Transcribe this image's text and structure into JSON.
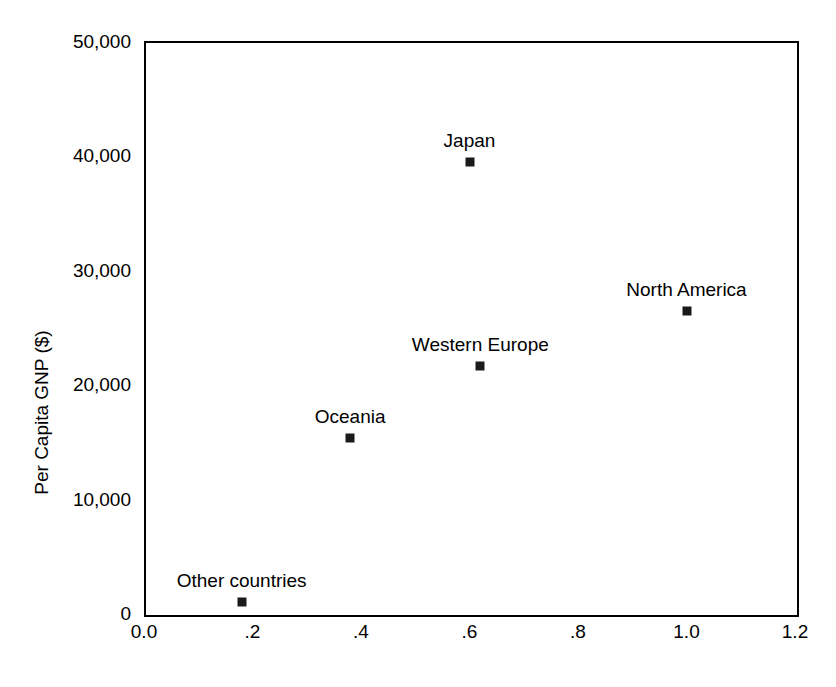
{
  "chart_data": {
    "type": "scatter",
    "title": "",
    "xlabel": "",
    "ylabel": "Per Capita GNP ($)",
    "xlim": [
      0.0,
      1.2
    ],
    "ylim": [
      0,
      50000
    ],
    "grid": false,
    "legend": "none",
    "marker": {
      "shape": "square",
      "color": "#1a1a1a",
      "size_px": 9
    },
    "xticks": [
      0.0,
      0.2,
      0.4,
      0.6,
      0.8,
      1.0,
      1.2
    ],
    "xticklabels": [
      "0.0",
      ".2",
      ".4",
      ".6",
      ".8",
      "1.0",
      "1.2"
    ],
    "yticks": [
      0,
      10000,
      20000,
      30000,
      40000,
      50000
    ],
    "yticklabels": [
      "0",
      "10,000",
      "20,000",
      "30,000",
      "40,000",
      "50,000"
    ],
    "points": [
      {
        "label": "Other countries",
        "x": 0.18,
        "y": 1000,
        "label_pos": "above"
      },
      {
        "label": "Oceania",
        "x": 0.38,
        "y": 15300,
        "label_pos": "above"
      },
      {
        "label": "Western Europe",
        "x": 0.62,
        "y": 21600,
        "label_pos": "above"
      },
      {
        "label": "Japan",
        "x": 0.6,
        "y": 39400,
        "label_pos": "above"
      },
      {
        "label": "North America",
        "x": 1.0,
        "y": 26400,
        "label_pos": "above"
      }
    ]
  }
}
